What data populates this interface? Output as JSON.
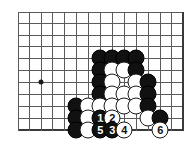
{
  "diagram": {
    "kind": "go-board-problem-diagram",
    "board": {
      "background_color": "#ffffff",
      "line_color": "#5a5a5a",
      "edge_color": "#3a3a3a",
      "vertical_lines_x": [
        18,
        29.6,
        41.2,
        52.8,
        64.4,
        76,
        88,
        100,
        112,
        124,
        136,
        148,
        160,
        171.5,
        183
      ],
      "horizontal_lines_y": [
        12,
        23.6,
        35.2,
        46.8,
        58.4,
        70,
        82,
        94,
        106,
        118,
        130
      ],
      "right_edge_x": 183,
      "bottom_edge_y": 130,
      "star_points": [
        {
          "x": 41.2,
          "y": 82
        }
      ]
    },
    "stones": [
      {
        "x": 100,
        "y": 58,
        "color": "black",
        "label": ""
      },
      {
        "x": 112,
        "y": 58,
        "color": "black",
        "label": ""
      },
      {
        "x": 124,
        "y": 58,
        "color": "black",
        "label": ""
      },
      {
        "x": 136,
        "y": 58,
        "color": "black",
        "label": ""
      },
      {
        "x": 100,
        "y": 70,
        "color": "black",
        "label": ""
      },
      {
        "x": 112,
        "y": 70,
        "color": "white",
        "label": ""
      },
      {
        "x": 124,
        "y": 70,
        "color": "white",
        "label": ""
      },
      {
        "x": 136,
        "y": 70,
        "color": "black",
        "label": ""
      },
      {
        "x": 100,
        "y": 82,
        "color": "black",
        "label": ""
      },
      {
        "x": 112,
        "y": 82,
        "color": "white",
        "label": ""
      },
      {
        "x": 136,
        "y": 82,
        "color": "white",
        "label": ""
      },
      {
        "x": 148,
        "y": 82,
        "color": "black",
        "label": ""
      },
      {
        "x": 100,
        "y": 94,
        "color": "black",
        "label": ""
      },
      {
        "x": 112,
        "y": 94,
        "color": "white",
        "label": ""
      },
      {
        "x": 124,
        "y": 94,
        "color": "white",
        "label": ""
      },
      {
        "x": 136,
        "y": 94,
        "color": "white",
        "label": ""
      },
      {
        "x": 148,
        "y": 94,
        "color": "black",
        "label": ""
      },
      {
        "x": 76,
        "y": 106,
        "color": "black",
        "label": ""
      },
      {
        "x": 88,
        "y": 106,
        "color": "white",
        "label": ""
      },
      {
        "x": 100,
        "y": 106,
        "color": "white",
        "label": ""
      },
      {
        "x": 112,
        "y": 106,
        "color": "white",
        "label": ""
      },
      {
        "x": 124,
        "y": 106,
        "color": "white",
        "label": ""
      },
      {
        "x": 136,
        "y": 106,
        "color": "white",
        "label": ""
      },
      {
        "x": 148,
        "y": 106,
        "color": "black",
        "label": ""
      },
      {
        "x": 76,
        "y": 118,
        "color": "black",
        "label": ""
      },
      {
        "x": 88,
        "y": 118,
        "color": "white",
        "label": ""
      },
      {
        "x": 100,
        "y": 118,
        "color": "black",
        "label": "1"
      },
      {
        "x": 112,
        "y": 118,
        "color": "white",
        "label": "2"
      },
      {
        "x": 148,
        "y": 118,
        "color": "white",
        "label": ""
      },
      {
        "x": 160,
        "y": 118,
        "color": "black",
        "label": ""
      },
      {
        "x": 76,
        "y": 130,
        "color": "black",
        "label": ""
      },
      {
        "x": 88,
        "y": 130,
        "color": "white",
        "label": ""
      },
      {
        "x": 100,
        "y": 130,
        "color": "black",
        "label": "5"
      },
      {
        "x": 112,
        "y": 130,
        "color": "black",
        "label": "3"
      },
      {
        "x": 124,
        "y": 130,
        "color": "white",
        "label": "4"
      },
      {
        "x": 160,
        "y": 130,
        "color": "white",
        "label": "6"
      }
    ]
  }
}
